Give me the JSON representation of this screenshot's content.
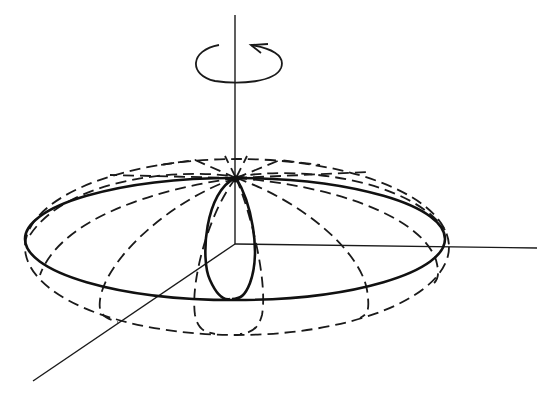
{
  "figure": {
    "labels": [],
    "elements": {
      "rotation_indicator": "counterclockwise-rotation-arrow-icon",
      "axes": [
        "vertical-rotation-axis",
        "horizontal-x-axis",
        "diagonal-y-axis"
      ],
      "solid_curves": [
        "equator-ellipse",
        "front-meridian-loop"
      ],
      "dashed_curves": [
        "outer-silhouette-ellipse",
        "meridian-lines"
      ]
    },
    "colors": {
      "background": "#ffffff",
      "ink": "#1a1a1a"
    }
  }
}
